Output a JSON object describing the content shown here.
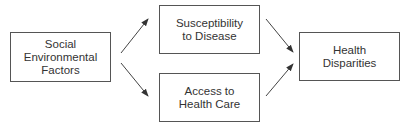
{
  "diagram": {
    "nodes": [
      {
        "id": "social",
        "label": "Social\nEnvironmental\nFactors"
      },
      {
        "id": "susceptibility",
        "label": "Susceptibility\nto Disease"
      },
      {
        "id": "access",
        "label": "Access to\nHealth Care"
      },
      {
        "id": "disparities",
        "label": "Health\nDisparities"
      }
    ],
    "edges": [
      {
        "from": "social",
        "to": "susceptibility"
      },
      {
        "from": "social",
        "to": "access"
      },
      {
        "from": "susceptibility",
        "to": "disparities"
      },
      {
        "from": "access",
        "to": "disparities"
      }
    ]
  }
}
